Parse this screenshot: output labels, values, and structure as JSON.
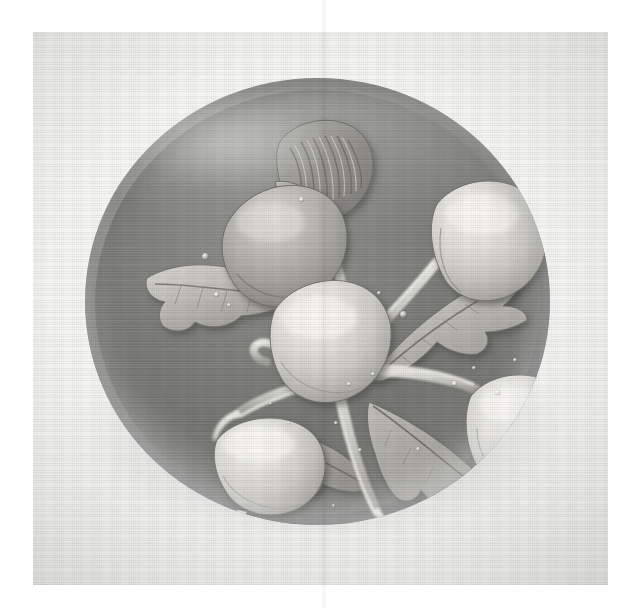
{
  "document": {
    "type": "black-and-white photographic plate",
    "medium": "printed halftone on textured paper",
    "caption": "",
    "page_artifacts": {
      "vertical_crease_x": 323,
      "white_margin_left": 33,
      "white_margin_top": 32
    }
  },
  "photo": {
    "subject": "glass paperweight",
    "motif": "lampwork fruit spray with five fruits and leaves",
    "frame": {
      "left": 33,
      "top": 32,
      "width": 575,
      "height": 553
    },
    "background_tone": "#f3f3f1"
  },
  "paperweight": {
    "name": "dome",
    "shape": "flattened sphere",
    "bounds": {
      "left": 52,
      "top": 46,
      "width": 465,
      "height": 447
    },
    "glass_tone": "#86867f",
    "ground_tone": "#7b7b78",
    "highlight_tone": "#ffffff",
    "shadow_tone": "#6a6a67"
  },
  "motif_elements": {
    "fruits": [
      {
        "id": "fruit-upper-left",
        "label": "Fruit (upper left)",
        "tone": "mid",
        "cx": 193,
        "cy": 180,
        "rx": 62,
        "ry": 52,
        "rot": -22
      },
      {
        "id": "fruit-upper-right",
        "label": "Fruit (upper right)",
        "tone": "light",
        "cx": 408,
        "cy": 168,
        "rx": 58,
        "ry": 52,
        "rot": -6
      },
      {
        "id": "fruit-center-left",
        "label": "Fruit (centre left)",
        "tone": "light",
        "cx": 250,
        "cy": 265,
        "rx": 58,
        "ry": 54,
        "rot": -12
      },
      {
        "id": "fruit-lower-right",
        "label": "Fruit (lower right)",
        "tone": "light",
        "cx": 441,
        "cy": 357,
        "rx": 56,
        "ry": 48,
        "rot": -10
      },
      {
        "id": "fruit-lower-left",
        "label": "Fruit (lower left)",
        "tone": "light",
        "cx": 190,
        "cy": 392,
        "rx": 54,
        "ry": 44,
        "rot": -8
      }
    ],
    "leaves": [
      {
        "id": "leaf-top-curled",
        "label": "Curled ribbed leaf (top)"
      },
      {
        "id": "leaf-left",
        "label": "Serrated leaf (left)"
      },
      {
        "id": "leaf-upper-right",
        "label": "Serrated leaf (upper right)"
      },
      {
        "id": "leaf-lower-right",
        "label": "Serrated leaf (lower right)"
      },
      {
        "id": "leaf-lower-centre",
        "label": "Serrated leaf (lower centre)"
      }
    ],
    "stems": {
      "id": "stem-spray",
      "label": "Branching stem spray",
      "junction": {
        "x": 300,
        "y": 290
      }
    },
    "bubbles": [
      {
        "x": 120,
        "y": 178,
        "d": 7
      },
      {
        "x": 131,
        "y": 216,
        "d": 5
      },
      {
        "x": 144,
        "y": 227,
        "d": 4
      },
      {
        "x": 216,
        "y": 121,
        "d": 5
      },
      {
        "x": 294,
        "y": 215,
        "d": 4
      },
      {
        "x": 318,
        "y": 236,
        "d": 7
      },
      {
        "x": 288,
        "y": 296,
        "d": 4
      },
      {
        "x": 264,
        "y": 306,
        "d": 4
      },
      {
        "x": 251,
        "y": 345,
        "d": 4
      },
      {
        "x": 203,
        "y": 344,
        "d": 3
      },
      {
        "x": 369,
        "y": 305,
        "d": 5
      },
      {
        "x": 389,
        "y": 290,
        "d": 4
      },
      {
        "x": 412,
        "y": 314,
        "d": 5
      },
      {
        "x": 430,
        "y": 282,
        "d": 4
      },
      {
        "x": 465,
        "y": 330,
        "d": 4
      },
      {
        "x": 333,
        "y": 371,
        "d": 4
      },
      {
        "x": 275,
        "y": 372,
        "d": 4
      },
      {
        "x": 185,
        "y": 325,
        "d": 3
      },
      {
        "x": 248,
        "y": 427,
        "d": 3
      },
      {
        "x": 396,
        "y": 442,
        "d": 4
      }
    ]
  }
}
